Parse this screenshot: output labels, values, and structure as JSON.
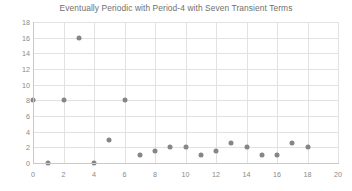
{
  "chart_data": {
    "type": "scatter",
    "title": "Eventually Periodic with Period-4 with Seven Transient Terms",
    "xlabel": "",
    "ylabel": "",
    "xlim": [
      0,
      20
    ],
    "ylim": [
      0,
      18
    ],
    "xticks": [
      0,
      2,
      4,
      6,
      8,
      10,
      12,
      14,
      16,
      18,
      20
    ],
    "yticks": [
      0,
      2,
      4,
      6,
      8,
      10,
      12,
      14,
      16,
      18
    ],
    "grid": true,
    "legend": null,
    "marker_color": "#868686",
    "x": [
      0,
      1,
      2,
      3,
      4,
      5,
      6,
      7,
      8,
      9,
      10,
      11,
      12,
      13,
      14,
      15,
      16,
      17,
      18
    ],
    "y": [
      8,
      0,
      8,
      16,
      0,
      3,
      8,
      1,
      1.5,
      2,
      2,
      1,
      1.5,
      2.5,
      2,
      1,
      1,
      2.5,
      2
    ],
    "points": [
      {
        "x": 0,
        "y": 8
      },
      {
        "x": 1,
        "y": 0
      },
      {
        "x": 2,
        "y": 8
      },
      {
        "x": 3,
        "y": 16
      },
      {
        "x": 4,
        "y": 0
      },
      {
        "x": 5,
        "y": 3
      },
      {
        "x": 6,
        "y": 8
      },
      {
        "x": 7,
        "y": 1
      },
      {
        "x": 8,
        "y": 1.5
      },
      {
        "x": 9,
        "y": 2
      },
      {
        "x": 10,
        "y": 2
      },
      {
        "x": 11,
        "y": 1
      },
      {
        "x": 12,
        "y": 1.5
      },
      {
        "x": 13,
        "y": 2.5
      },
      {
        "x": 14,
        "y": 2
      },
      {
        "x": 15,
        "y": 1
      },
      {
        "x": 16,
        "y": 1
      },
      {
        "x": 17,
        "y": 2.5
      },
      {
        "x": 18,
        "y": 2
      }
    ]
  }
}
